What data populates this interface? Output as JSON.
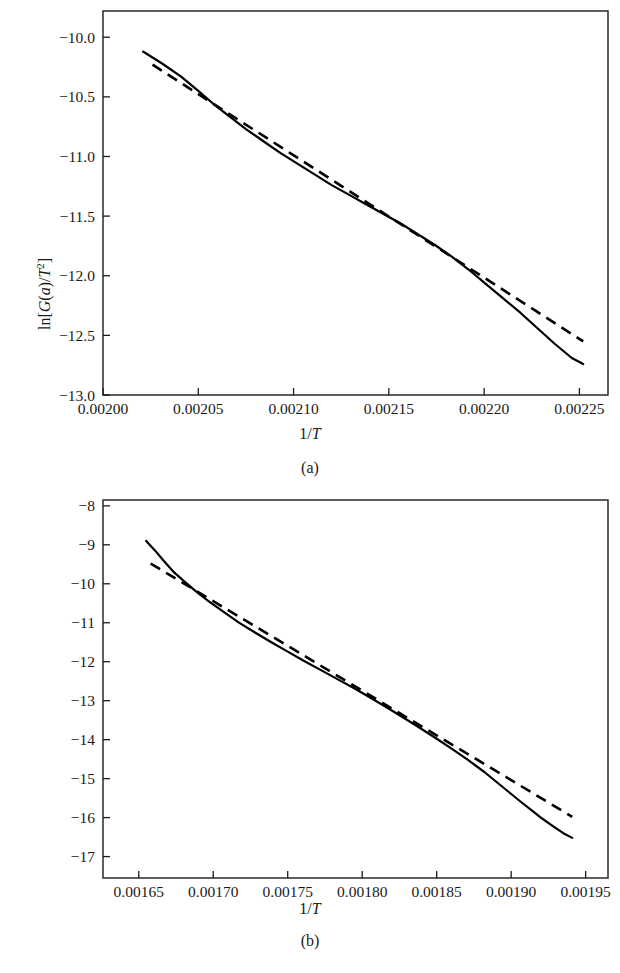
{
  "figure": {
    "panels": [
      {
        "caption": "(a)",
        "xlabel_plain": "1/T",
        "ylabel_plain": "ln[G(a)/T^2]"
      },
      {
        "caption": "(b)",
        "xlabel_plain": "1/T",
        "ylabel_plain": "ln[G(a)/T^2]"
      }
    ]
  },
  "chart_data": [
    {
      "type": "line",
      "panel": "(a)",
      "title": "",
      "xlabel": "1/T",
      "ylabel": "ln[G(a)/T^2]",
      "xlim": [
        0.002,
        0.002265
      ],
      "ylim": [
        -13.0,
        -9.78
      ],
      "xticks": [
        0.002,
        0.00205,
        0.0021,
        0.00215,
        0.0022,
        0.00225
      ],
      "xtick_labels": [
        "0.00200",
        "0.00205",
        "0.00210",
        "0.00215",
        "0.00220",
        "0.00225"
      ],
      "yticks": [
        -10.0,
        -10.5,
        -11.0,
        -11.5,
        -12.0,
        -12.5,
        -13.0
      ],
      "ytick_labels": [
        "-10.0",
        "-10.5",
        "-11.0",
        "-11.5",
        "-12.0",
        "-12.5",
        "-13.0"
      ],
      "grid": false,
      "legend": "none",
      "series": [
        {
          "name": "experimental",
          "style": "solid",
          "x": [
            0.002021,
            0.002031,
            0.002041,
            0.00205,
            0.002058,
            0.002066,
            0.002075,
            0.002084,
            0.002093,
            0.002102,
            0.002111,
            0.00212,
            0.002129,
            0.002138,
            0.002147,
            0.002156,
            0.002165,
            0.002174,
            0.002183,
            0.002192,
            0.002201,
            0.00221,
            0.002219,
            0.002228,
            0.002237,
            0.002246,
            0.002252
          ],
          "y": [
            -10.12,
            -10.22,
            -10.33,
            -10.45,
            -10.56,
            -10.66,
            -10.77,
            -10.87,
            -10.97,
            -11.06,
            -11.15,
            -11.24,
            -11.32,
            -11.4,
            -11.48,
            -11.56,
            -11.65,
            -11.74,
            -11.84,
            -11.95,
            -12.07,
            -12.19,
            -12.31,
            -12.44,
            -12.57,
            -12.69,
            -12.74
          ]
        },
        {
          "name": "linear-fit",
          "style": "dashed",
          "x": [
            0.002026,
            0.002252
          ],
          "y": [
            -10.23,
            -12.55
          ]
        }
      ]
    },
    {
      "type": "line",
      "panel": "(b)",
      "title": "",
      "xlabel": "1/T",
      "ylabel": "ln[G(a)/T^2]",
      "xlim": [
        0.001626,
        0.001965
      ],
      "ylim": [
        -17.55,
        -7.85
      ],
      "xticks": [
        0.00165,
        0.0017,
        0.00175,
        0.0018,
        0.00185,
        0.0019,
        0.00195
      ],
      "xtick_labels": [
        "0.00165",
        "0.00170",
        "0.00175",
        "0.00180",
        "0.00185",
        "0.00190",
        "0.00195"
      ],
      "yticks": [
        -8,
        -9,
        -10,
        -11,
        -12,
        -13,
        -14,
        -15,
        -16,
        -17
      ],
      "ytick_labels": [
        "-8",
        "-9",
        "-10",
        "-11",
        "-12",
        "-13",
        "-14",
        "-15",
        "-16",
        "-17"
      ],
      "grid": false,
      "legend": "none",
      "series": [
        {
          "name": "experimental",
          "style": "solid",
          "x": [
            0.001655,
            0.001661,
            0.001667,
            0.001673,
            0.00168,
            0.001688,
            0.001697,
            0.001707,
            0.001717,
            0.001728,
            0.001739,
            0.00175,
            0.001761,
            0.001772,
            0.001783,
            0.001794,
            0.001805,
            0.001816,
            0.001827,
            0.001838,
            0.001849,
            0.00186,
            0.001871,
            0.001882,
            0.00189,
            0.001898,
            0.001906,
            0.001914,
            0.001921,
            0.001928,
            0.001935,
            0.001941
          ],
          "y": [
            -8.9,
            -9.15,
            -9.42,
            -9.68,
            -9.92,
            -10.18,
            -10.45,
            -10.72,
            -10.99,
            -11.25,
            -11.5,
            -11.74,
            -11.98,
            -12.21,
            -12.44,
            -12.67,
            -12.91,
            -13.16,
            -13.42,
            -13.68,
            -13.95,
            -14.23,
            -14.52,
            -14.83,
            -15.08,
            -15.33,
            -15.58,
            -15.82,
            -16.03,
            -16.22,
            -16.4,
            -16.52
          ]
        },
        {
          "name": "linear-fit",
          "style": "dashed",
          "x": [
            0.001658,
            0.001941
          ],
          "y": [
            -9.48,
            -15.98
          ]
        }
      ]
    }
  ]
}
